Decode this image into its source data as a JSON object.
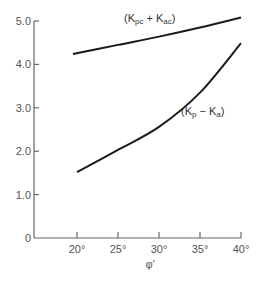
{
  "chart_data": {
    "type": "line",
    "title": "",
    "xlabel": "φ′",
    "ylabel": "",
    "xlim": [
      15.5,
      40
    ],
    "ylim": [
      0,
      5.0
    ],
    "x_ticks": [
      20,
      25,
      30,
      35,
      40
    ],
    "x_tick_labels": [
      "20°",
      "25°",
      "30°",
      "35°",
      "40°"
    ],
    "y_ticks": [
      0,
      1.0,
      2.0,
      3.0,
      4.0,
      5.0
    ],
    "y_tick_labels": [
      "0",
      "1.0",
      "2.0",
      "3.0",
      "4.0",
      "5.0"
    ],
    "grid": false,
    "series": [
      {
        "name": "(Kpc + Kac)",
        "label_main": "(K",
        "label_sub1": "pc",
        "label_mid": " + K",
        "label_sub2": "ac",
        "label_end": ")",
        "x": [
          19.5,
          25,
          30,
          35,
          40
        ],
        "values": [
          4.24,
          4.45,
          4.64,
          4.85,
          5.08
        ]
      },
      {
        "name": "(Kp − Ka)",
        "label_main": "(K",
        "label_sub1": "p",
        "label_mid": " − K",
        "label_sub2": "a",
        "label_end": ")",
        "x": [
          20,
          25,
          30,
          35,
          40
        ],
        "values": [
          1.52,
          2.03,
          2.56,
          3.35,
          4.49
        ]
      }
    ]
  }
}
